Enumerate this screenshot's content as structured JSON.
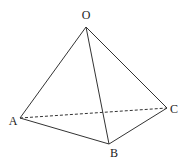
{
  "diagram": {
    "type": "tetrahedron",
    "vertices": {
      "O": {
        "label": "O",
        "x": 86,
        "y": 27,
        "lx": 86,
        "ly": 19
      },
      "A": {
        "label": "A",
        "x": 20,
        "y": 118,
        "lx": 13,
        "ly": 125
      },
      "B": {
        "label": "B",
        "x": 109,
        "y": 144,
        "lx": 114,
        "ly": 157
      },
      "C": {
        "label": "C",
        "x": 167,
        "y": 108,
        "lx": 174,
        "ly": 113
      }
    },
    "edges": [
      {
        "from": "O",
        "to": "A",
        "style": "solid"
      },
      {
        "from": "O",
        "to": "B",
        "style": "solid"
      },
      {
        "from": "O",
        "to": "C",
        "style": "solid"
      },
      {
        "from": "A",
        "to": "B",
        "style": "solid"
      },
      {
        "from": "B",
        "to": "C",
        "style": "solid"
      },
      {
        "from": "A",
        "to": "C",
        "style": "dashed"
      }
    ]
  }
}
